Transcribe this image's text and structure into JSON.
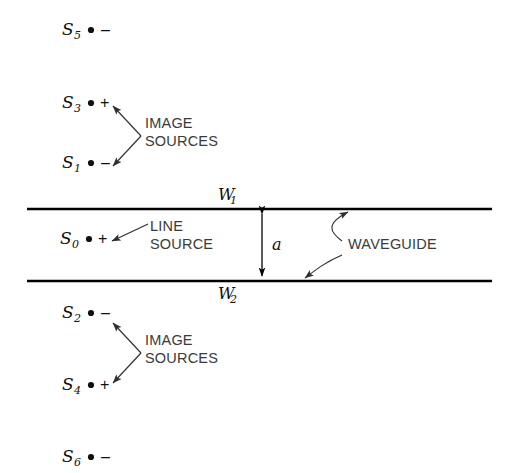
{
  "figure": {
    "background_color": "#ffffff",
    "line_color": "#000000",
    "callout_color": "#3a3a3a"
  },
  "sources": [
    {
      "id": "s5",
      "label": "S",
      "subscript": "5",
      "sign": "–",
      "x": 62,
      "y": 35,
      "dot_x": 91,
      "sign_x": 101
    },
    {
      "id": "s3",
      "label": "S",
      "subscript": "3",
      "sign": "+",
      "x": 62,
      "y": 108,
      "dot_x": 91,
      "sign_x": 100
    },
    {
      "id": "s1",
      "label": "S",
      "subscript": "1",
      "sign": "–",
      "x": 62,
      "y": 168,
      "dot_x": 91,
      "sign_x": 101
    },
    {
      "id": "s0",
      "label": "S",
      "subscript": "0",
      "sign": "+",
      "x": 60,
      "y": 244,
      "dot_x": 89,
      "sign_x": 98
    },
    {
      "id": "s2",
      "label": "S",
      "subscript": "2",
      "sign": "–",
      "x": 62,
      "y": 318,
      "dot_x": 91,
      "sign_x": 101
    },
    {
      "id": "s4",
      "label": "S",
      "subscript": "4",
      "sign": "+",
      "x": 62,
      "y": 390,
      "dot_x": 91,
      "sign_x": 100
    },
    {
      "id": "s6",
      "label": "S",
      "subscript": "6",
      "sign": "–",
      "x": 62,
      "y": 462,
      "dot_x": 91,
      "sign_x": 101
    }
  ],
  "callouts": {
    "image_sources_top": {
      "line1": "IMAGE",
      "line2": "SOURCES",
      "x": 145,
      "y1": 128,
      "y2": 146
    },
    "image_sources_bottom": {
      "line1": "IMAGE",
      "line2": "SOURCES",
      "x": 145,
      "y1": 345,
      "y2": 363
    },
    "line_source": {
      "line1": "LINE",
      "line2": "SOURCE",
      "x": 150,
      "y1": 231,
      "y2": 249
    },
    "waveguide": {
      "text": "WAVEGUIDE",
      "x": 348,
      "y": 249
    }
  },
  "waveguide": {
    "wall_top_label": "W",
    "wall_top_subscript": "1",
    "wall_top_label_x": 218,
    "wall_top_label_y": 200,
    "wall_bottom_label": "W",
    "wall_bottom_subscript": "2",
    "wall_bottom_label_x": 218,
    "wall_bottom_label_y": 299,
    "wall_top_y": 209,
    "wall_bottom_y": 281,
    "wall_x_start": 27,
    "wall_x_end": 492,
    "dimension_label": "a",
    "dimension_label_x": 272,
    "dimension_label_y": 250,
    "dimension_x": 262
  }
}
